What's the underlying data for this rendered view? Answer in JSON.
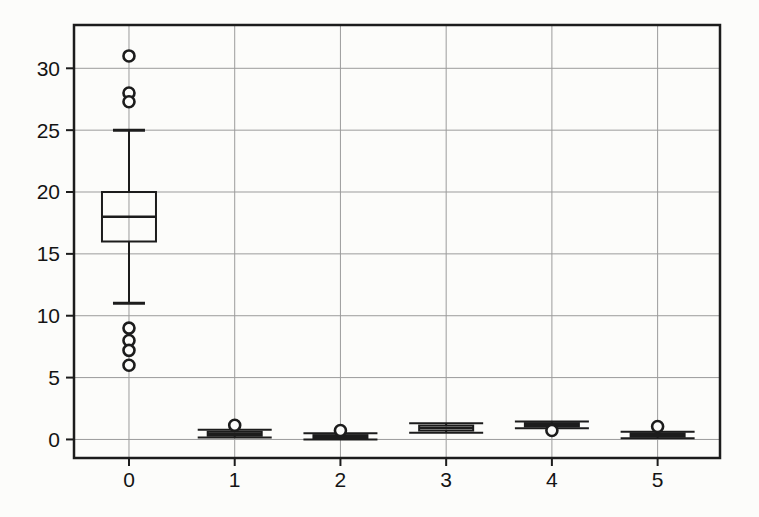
{
  "figure": {
    "kind": "scanned-boxplot-figure",
    "width_px": 759,
    "height_px": 517
  },
  "chart_data": {
    "type": "boxplot",
    "title": "",
    "xlabel": "",
    "ylabel": "",
    "categories": [
      "0",
      "1",
      "2",
      "3",
      "4",
      "5"
    ],
    "x_tick_labels": [
      "0",
      "1",
      "2",
      "3",
      "4",
      "5"
    ],
    "y_tick_labels": [
      "0",
      "5",
      "10",
      "15",
      "20",
      "25",
      "30"
    ],
    "y_ticks": [
      0,
      5,
      10,
      15,
      20,
      25,
      30
    ],
    "xlim": [
      -0.52,
      5.59
    ],
    "ylim": [
      -1.5,
      33.5
    ],
    "grid": true,
    "legend": "none",
    "background_color": "#fcfcfa",
    "line_color": "#1c1c1c",
    "grid_color": "#9b9b9b",
    "text_color": "#141414",
    "boxes": [
      {
        "category": "0",
        "whislo": 11,
        "q1": 16,
        "median": 18,
        "q3": 20,
        "whishi": 25,
        "fliers": [
          31,
          28,
          27.3,
          9,
          8,
          7.2,
          6
        ]
      },
      {
        "category": "1",
        "whislo": 0.15,
        "q1": 0.3,
        "median": 0.45,
        "q3": 0.62,
        "whishi": 0.78,
        "fliers": [
          1.15
        ]
      },
      {
        "category": "2",
        "whislo": 0.0,
        "q1": 0.1,
        "median": 0.22,
        "q3": 0.35,
        "whishi": 0.5,
        "fliers": [
          0.72
        ]
      },
      {
        "category": "3",
        "whislo": 0.55,
        "q1": 0.72,
        "median": 0.92,
        "q3": 1.12,
        "whishi": 1.3,
        "fliers": []
      },
      {
        "category": "4",
        "whislo": 0.9,
        "q1": 1.05,
        "median": 1.18,
        "q3": 1.32,
        "whishi": 1.45,
        "fliers": [
          0.72
        ]
      },
      {
        "category": "5",
        "whislo": 0.1,
        "q1": 0.22,
        "median": 0.35,
        "q3": 0.5,
        "whishi": 0.63,
        "fliers": [
          1.05
        ]
      }
    ]
  }
}
